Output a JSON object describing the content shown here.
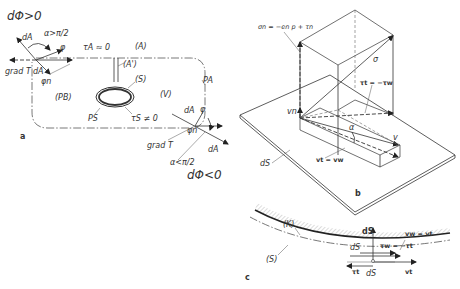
{
  "figure": {
    "panel_a": {
      "panel_label": "a",
      "top_condition": "dΦ>0",
      "bottom_condition": "dΦ<0",
      "angle_obtuse": "α>π/2",
      "angle_acute": "α<π/2",
      "dA_top": "dA",
      "dA_top2": "dA",
      "dA_bottom": "dA",
      "dA_bottom2": "dA",
      "phi_top": "φ",
      "phi_bottom": "φ",
      "phin_top": "φn",
      "phin_bottom": "φn",
      "grad_top": "grad T",
      "grad_bottom": "grad T",
      "tau_A": "τA ≈ 0",
      "region_A": "(A)",
      "region_A_prime": "(A')",
      "region_S": "(S)",
      "region_PB": "(PB)",
      "region_V": "(V)",
      "P_A": "PA",
      "P_S": "PS",
      "tau_S": "τS ≠ 0"
    },
    "panel_b": {
      "panel_label": "b",
      "sigma_n": "σn = −en p + τn",
      "sigma": "σ",
      "tau_t": "τt = −τw",
      "v_n": "vn",
      "alpha": "α",
      "v": "v",
      "v_t": "vt = vw",
      "dS": "dS"
    },
    "panel_c": {
      "panel_label": "c",
      "K": "(K)",
      "S": "(S)",
      "dS_vec": "dS",
      "dS_upper": "dS",
      "dS_lower": "dS",
      "v_w": "vw = vt",
      "tau_w": "τw = −τt",
      "tau_t": "τt",
      "v_t": "vt"
    }
  }
}
